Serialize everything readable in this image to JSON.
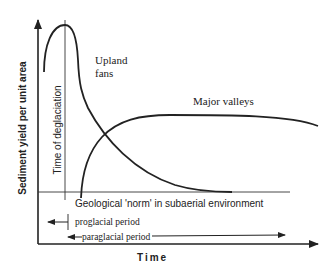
{
  "diagram": {
    "y_axis_label": "Sediment  yield  per  unit  area",
    "x_axis_label": "Time",
    "deglaciation_label": "Time  of  deglaciation",
    "baseline_label": "Geological  'norm'  in  subaerial  environment",
    "curves": [
      {
        "name": "upland-fans",
        "label_line1": "Upland",
        "label_line2": "fans"
      },
      {
        "name": "major-valleys",
        "label": "Major valleys"
      }
    ],
    "periods": [
      {
        "name": "proglacial",
        "label": "proglacial period"
      },
      {
        "name": "paraglacial",
        "label": "paraglacial period"
      }
    ],
    "colors": {
      "ink": "#222222",
      "background": "#ffffff"
    }
  }
}
